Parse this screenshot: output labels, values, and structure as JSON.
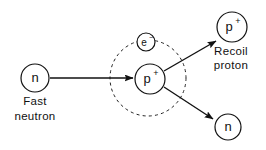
{
  "diagram": {
    "background_color": "#ffffff",
    "stroke_color": "#111111",
    "nodes": {
      "incident_neutron": {
        "symbol": "n",
        "caption_line1": "Fast",
        "caption_line2": "neutron",
        "cx": 35,
        "cy": 78,
        "r": 14
      },
      "target_proton": {
        "symbol": "p",
        "charge": "+",
        "cx": 150,
        "cy": 79,
        "r": 15
      },
      "orbital_electron": {
        "symbol": "e",
        "charge": "−",
        "cx": 146,
        "cy": 42,
        "r": 9
      },
      "recoil_proton": {
        "symbol": "p",
        "charge": "+",
        "caption_line1": "Recoil",
        "caption_line2": "proton",
        "cx": 232,
        "cy": 27,
        "r": 15
      },
      "scattered_neutron": {
        "symbol": "n",
        "cx": 228,
        "cy": 127,
        "r": 13
      },
      "atom_shell": {
        "label": "hydrogen-atom-shell",
        "cx": 148,
        "cy": 78,
        "r": 38,
        "style": "dashed"
      }
    },
    "arrows": [
      {
        "name": "incident-neutron-arrow",
        "x1": 50,
        "y1": 78,
        "x2": 133,
        "y2": 78
      },
      {
        "name": "recoil-proton-arrow",
        "x1": 164,
        "y1": 71,
        "x2": 216,
        "y2": 41
      },
      {
        "name": "scattered-neutron-arrow",
        "x1": 164,
        "y1": 87,
        "x2": 213,
        "y2": 119
      }
    ]
  }
}
